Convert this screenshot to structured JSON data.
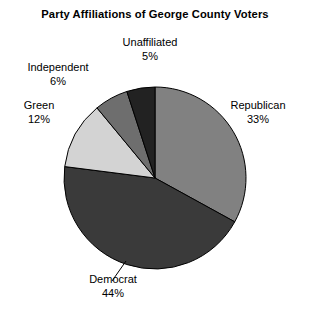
{
  "chart_data": {
    "type": "pie",
    "title": "Party Affiliations of George County Voters",
    "xlabel": "",
    "ylabel": "",
    "legend": "none",
    "grid": false,
    "labels_position": "outside",
    "start_angle_deg": 0,
    "direction": "clockwise",
    "categories": [
      "Republican",
      "Democrat",
      "Green",
      "Independent",
      "Unaffiliated"
    ],
    "values": [
      33,
      44,
      12,
      6,
      5
    ],
    "units": "percent",
    "total": 100,
    "slices": [
      {
        "name": "Republican",
        "value": 33,
        "value_label": "33%",
        "color": "#818181"
      },
      {
        "name": "Democrat",
        "value": 44,
        "value_label": "44%",
        "color": "#3a3a3a"
      },
      {
        "name": "Green",
        "value": 12,
        "value_label": "12%",
        "color": "#d3d3d3"
      },
      {
        "name": "Independent",
        "value": 6,
        "value_label": "6%",
        "color": "#6e6e6e"
      },
      {
        "name": "Unaffiliated",
        "value": 5,
        "value_label": "5%",
        "color": "#222222"
      }
    ]
  },
  "figure": {
    "background": "#ffffff",
    "outline_color": "#000000"
  }
}
